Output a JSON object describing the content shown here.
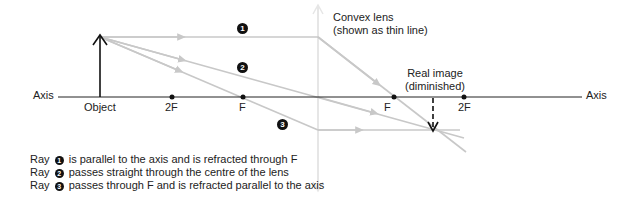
{
  "diagram": {
    "labels": {
      "axis_left": "Axis",
      "axis_right": "Axis",
      "object": "Object",
      "left_2f": "2F",
      "left_f": "F",
      "right_f": "F",
      "right_2f": "2F",
      "lens_line1": "Convex lens",
      "lens_line2": "(shown as thin line)",
      "image_line1": "Real image",
      "image_line2": "(diminished)"
    },
    "ray_markers": [
      "1",
      "2",
      "3"
    ],
    "legend": [
      {
        "prefix": "Ray",
        "num": "1",
        "text": "is parallel to the axis and is refracted through F"
      },
      {
        "prefix": "Ray",
        "num": "2",
        "text": "passes straight through the centre of the lens"
      },
      {
        "prefix": "Ray",
        "num": "3",
        "text": "passes through F and is refracted parallel to the axis"
      }
    ],
    "colors": {
      "axis": "#222222",
      "ray": "#c8c8c8",
      "lens": "#e6e6e6",
      "text": "#222222"
    }
  }
}
